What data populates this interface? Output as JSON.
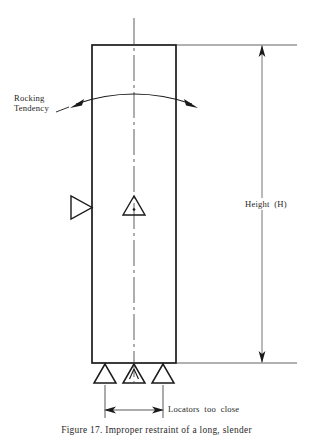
{
  "figure": {
    "title_caption": "Figure 17. Improper restraint of a long, slender",
    "background_color": "#ffffff",
    "line_color": "#1a1a1a"
  },
  "annotations": {
    "rocking_label": "Rocking\nTendency",
    "height_label": "Height  (H)",
    "locators_label": "Locators  too  close"
  },
  "part": {
    "name": "workpiece-body",
    "left": 92,
    "right": 176,
    "top": 45,
    "bottom": 363,
    "width": 84,
    "height": 318
  },
  "centerline": {
    "x": 134,
    "top": 18,
    "bottom": 382,
    "style": "long-dash-short-dash"
  },
  "dimension": {
    "height": {
      "x": 262,
      "top": 45,
      "bottom": 363,
      "label": "Height  (H)"
    },
    "locator_span": {
      "y": 410,
      "left": 105,
      "right": 163,
      "label": "Locators  too  close"
    }
  },
  "locators": [
    {
      "name": "locator-left",
      "x": 105,
      "type": "support-triangle"
    },
    {
      "name": "locator-center",
      "x": 134,
      "type": "support-triangle-marked"
    },
    {
      "name": "locator-right",
      "x": 163,
      "type": "support-triangle"
    }
  ],
  "side_locator": {
    "name": "side-locator",
    "x": 78,
    "y": 207,
    "direction": "right"
  },
  "center_marker": {
    "name": "center-locator-marker",
    "x": 134,
    "y": 207
  },
  "rocking_arc": {
    "left_arrow_x": 72,
    "right_arrow_x": 196,
    "apex_y": 95,
    "direction": "bidirectional"
  }
}
